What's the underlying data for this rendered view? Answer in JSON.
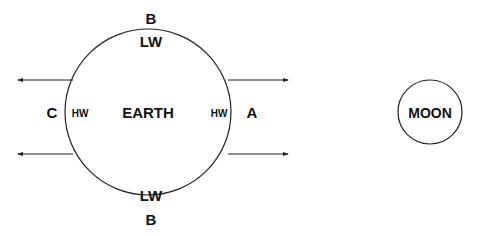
{
  "diagram": {
    "earth": {
      "label": "EARTH",
      "cx": 148,
      "cy": 112,
      "r": 83
    },
    "moon": {
      "label": "MOON",
      "cx": 430,
      "cy": 112,
      "r": 32
    },
    "points": {
      "A": "A",
      "B_top": "B",
      "B_bottom": "B",
      "C": "C"
    },
    "water": {
      "top": "LW",
      "bottom": "LW",
      "left": "HW",
      "right": "HW"
    },
    "colors": {
      "stroke": "#222222",
      "text": "#111111",
      "background": "#ffffff"
    }
  }
}
